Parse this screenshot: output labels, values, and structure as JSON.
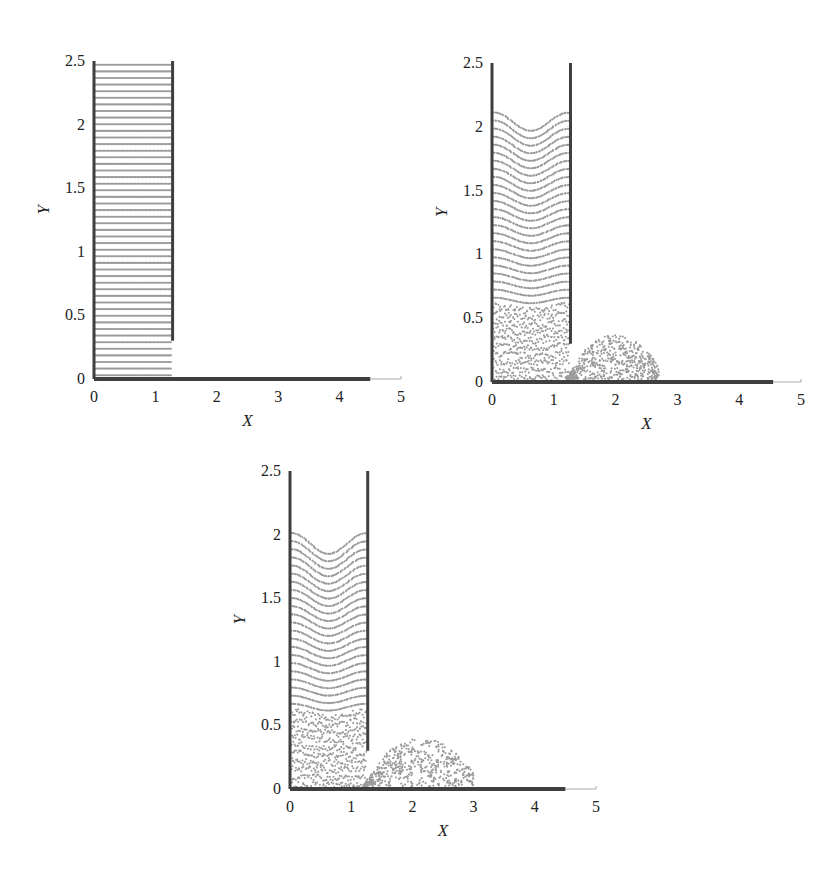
{
  "chart_data": [
    {
      "type": "scatter",
      "title": "",
      "xlabel": "X",
      "ylabel": "Y",
      "xlim": [
        0,
        5
      ],
      "ylim": [
        0,
        2.5
      ],
      "xticks": [
        "0",
        "1",
        "2",
        "3",
        "4",
        "5"
      ],
      "yticks": [
        "0",
        "0.5",
        "1",
        "1.5",
        "2",
        "2.5"
      ],
      "grid": false,
      "description": "Initial state: water column in tank, gate region, evenly layered particles",
      "walls": {
        "left_x": 0,
        "right_x": 1.28,
        "right_wall_bottom_y": 0.3,
        "wall_top_y": 2.5,
        "floor_end_x": 4.5
      },
      "fluid": {
        "x_range": [
          0.02,
          1.27
        ],
        "surface_y": 2.47,
        "surface_dip": 0.0,
        "layers": 48,
        "surge": null
      },
      "px": {
        "x0": 94,
        "x5": 401,
        "y0": 379,
        "y25": 61
      }
    },
    {
      "type": "scatter",
      "title": "",
      "xlabel": "X",
      "ylabel": "Y",
      "xlim": [
        0,
        5
      ],
      "ylim": [
        0,
        2.5
      ],
      "xticks": [
        "0",
        "1",
        "2",
        "3",
        "4",
        "5"
      ],
      "yticks": [
        "0",
        "0.5",
        "1",
        "1.5",
        "2",
        "2.5"
      ],
      "grid": false,
      "description": "Intermediate state: surface drops to ~2.1 with curved meniscus; outflow surge reaches x~2.7, peak height ~0.35 near x~2",
      "walls": {
        "left_x": 0,
        "right_x": 1.27,
        "right_wall_bottom_y": 0.3,
        "wall_top_y": 2.5,
        "floor_end_x": 4.55
      },
      "fluid": {
        "x_range": [
          0.03,
          1.25
        ],
        "surface_y": 2.1,
        "surface_dip": 0.12,
        "layers": 34,
        "surge": {
          "x_start": 1.2,
          "x_end": 2.7,
          "peak_x": 1.95,
          "peak_y": 0.35
        }
      },
      "px": {
        "x0": 492,
        "x5": 801,
        "y0": 382,
        "y25": 63
      }
    },
    {
      "type": "scatter",
      "title": "",
      "xlabel": "X",
      "ylabel": "Y",
      "xlim": [
        0,
        5
      ],
      "ylim": [
        0,
        2.5
      ],
      "xticks": [
        "0",
        "1",
        "2",
        "3",
        "4",
        "5"
      ],
      "yticks": [
        "0",
        "0.5",
        "1",
        "1.5",
        "2",
        "2.5"
      ],
      "grid": false,
      "description": "Later state: surface at ~2.0 with dip to ~1.87; surge reaches x~3.0, peak height ~0.38 near x~2",
      "walls": {
        "left_x": 0,
        "right_x": 1.27,
        "right_wall_bottom_y": 0.3,
        "wall_top_y": 2.5,
        "floor_end_x": 4.5
      },
      "fluid": {
        "x_range": [
          0.03,
          1.25
        ],
        "surface_y": 2.0,
        "surface_dip": 0.14,
        "layers": 32,
        "surge": {
          "x_start": 1.2,
          "x_end": 3.0,
          "peak_x": 2.0,
          "peak_y": 0.38
        }
      },
      "px": {
        "x0": 290,
        "x5": 596,
        "y0": 789,
        "y25": 471
      }
    }
  ],
  "colors": {
    "particle": "#9a9a9a",
    "wall": "#3f3f3f",
    "axis": "#555555",
    "text": "#222222"
  },
  "labels": {
    "x": "X",
    "y": "Y"
  }
}
